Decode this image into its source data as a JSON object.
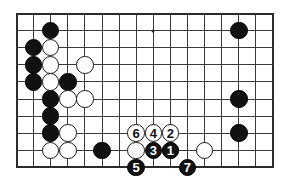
{
  "diagram": {
    "kind": "go-board-diagram",
    "board": {
      "cols": 16,
      "rows": 10,
      "cell": 17.1,
      "origin_x": 16.5,
      "origin_y": 13.5,
      "line_color": "#3a3a3a",
      "edge_color": "#2b2b2b",
      "background_color": "#ffffff",
      "hoshi_color": "#2b2b2b",
      "hoshi_points": [
        {
          "col": 2,
          "row": 1
        },
        {
          "col": 8,
          "row": 1
        }
      ]
    },
    "colors": {
      "black_stone": "#111111",
      "white_stone": "#fdfdfd",
      "white_stone_border": "#1a1a1a",
      "black_label": "#ffffff",
      "white_label": "#111111"
    },
    "stones": [
      {
        "col": 2,
        "row": 1,
        "color": "black",
        "label": ""
      },
      {
        "col": 1,
        "row": 2,
        "color": "black",
        "label": ""
      },
      {
        "col": 2,
        "row": 2,
        "color": "white",
        "label": ""
      },
      {
        "col": 1,
        "row": 3,
        "color": "black",
        "label": ""
      },
      {
        "col": 2,
        "row": 3,
        "color": "white",
        "label": ""
      },
      {
        "col": 4,
        "row": 3,
        "color": "white",
        "label": ""
      },
      {
        "col": 1,
        "row": 4,
        "color": "black",
        "label": ""
      },
      {
        "col": 2,
        "row": 4,
        "color": "white",
        "label": ""
      },
      {
        "col": 3,
        "row": 4,
        "color": "black",
        "label": ""
      },
      {
        "col": 2,
        "row": 5,
        "color": "black",
        "label": ""
      },
      {
        "col": 3,
        "row": 5,
        "color": "white",
        "label": ""
      },
      {
        "col": 4,
        "row": 5,
        "color": "white",
        "label": ""
      },
      {
        "col": 2,
        "row": 6,
        "color": "black",
        "label": ""
      },
      {
        "col": 2,
        "row": 7,
        "color": "black",
        "label": ""
      },
      {
        "col": 3,
        "row": 7,
        "color": "white",
        "label": ""
      },
      {
        "col": 2,
        "row": 8,
        "color": "white",
        "label": ""
      },
      {
        "col": 3,
        "row": 8,
        "color": "white",
        "label": ""
      },
      {
        "col": 5,
        "row": 8,
        "color": "black",
        "label": ""
      },
      {
        "col": 13,
        "row": 1,
        "color": "black",
        "label": ""
      },
      {
        "col": 13,
        "row": 5,
        "color": "black",
        "label": ""
      },
      {
        "col": 13,
        "row": 7,
        "color": "black",
        "label": ""
      },
      {
        "col": 11,
        "row": 8,
        "color": "white",
        "label": ""
      },
      {
        "col": 7,
        "row": 8,
        "color": "white",
        "label": ""
      },
      {
        "col": 9,
        "row": 8,
        "color": "white",
        "label": ""
      },
      {
        "col": 8,
        "row": 7,
        "color": "white",
        "label": "4"
      },
      {
        "col": 7,
        "row": 7,
        "color": "white",
        "label": "6"
      },
      {
        "col": 9,
        "row": 7,
        "color": "white",
        "label": "2"
      },
      {
        "col": 8,
        "row": 8,
        "color": "black",
        "label": "3"
      },
      {
        "col": 9,
        "row": 8,
        "color": "black",
        "label": "1"
      },
      {
        "col": 7,
        "row": 9,
        "color": "black",
        "label": "5"
      },
      {
        "col": 10,
        "row": 9,
        "color": "black",
        "label": "7"
      }
    ],
    "move_sequence": [
      {
        "number": "1",
        "color": "black",
        "col": 9,
        "row": 8
      },
      {
        "number": "2",
        "color": "white",
        "col": 9,
        "row": 7
      },
      {
        "number": "3",
        "color": "black",
        "col": 8,
        "row": 8
      },
      {
        "number": "4",
        "color": "white",
        "col": 8,
        "row": 7
      },
      {
        "number": "5",
        "color": "black",
        "col": 7,
        "row": 9
      },
      {
        "number": "6",
        "color": "white",
        "col": 7,
        "row": 7
      },
      {
        "number": "7",
        "color": "black",
        "col": 10,
        "row": 9
      }
    ]
  }
}
